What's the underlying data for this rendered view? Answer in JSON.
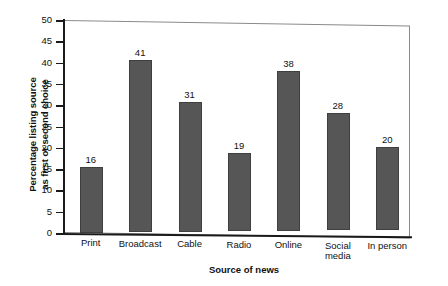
{
  "chart_data": {
    "type": "bar",
    "title": "",
    "subtitle": "",
    "xlabel": "Source of news",
    "ylabel": "Percentage listing source as first or second choice",
    "ylabel_line1": "Percentage listing source",
    "ylabel_line2": "as first or second choice",
    "categories": [
      "Print",
      "Broadcast",
      "Cable",
      "Radio",
      "Online",
      "Social media",
      "In person"
    ],
    "category_lines": [
      [
        "Print"
      ],
      [
        "Broadcast"
      ],
      [
        "Cable"
      ],
      [
        "Radio"
      ],
      [
        "Online"
      ],
      [
        "Social",
        "media"
      ],
      [
        "In person"
      ]
    ],
    "values": [
      16,
      41,
      31,
      19,
      38,
      28,
      20
    ],
    "data_labels": [
      "16",
      "41",
      "31",
      "19",
      "38",
      "28",
      "20"
    ],
    "ylim": [
      0,
      50
    ],
    "yticks": [
      0,
      5,
      10,
      15,
      20,
      25,
      30,
      35,
      40,
      45,
      50
    ],
    "ytick_labels": [
      "0",
      "5",
      "10",
      "15",
      "20",
      "25",
      "30",
      "35",
      "40",
      "45",
      "50"
    ],
    "grid": false,
    "legend": "none",
    "bar_color": "#565656",
    "axis_color": "#1a1a1a",
    "frame_color": "#8a8a8a",
    "background": "#ffffff"
  }
}
